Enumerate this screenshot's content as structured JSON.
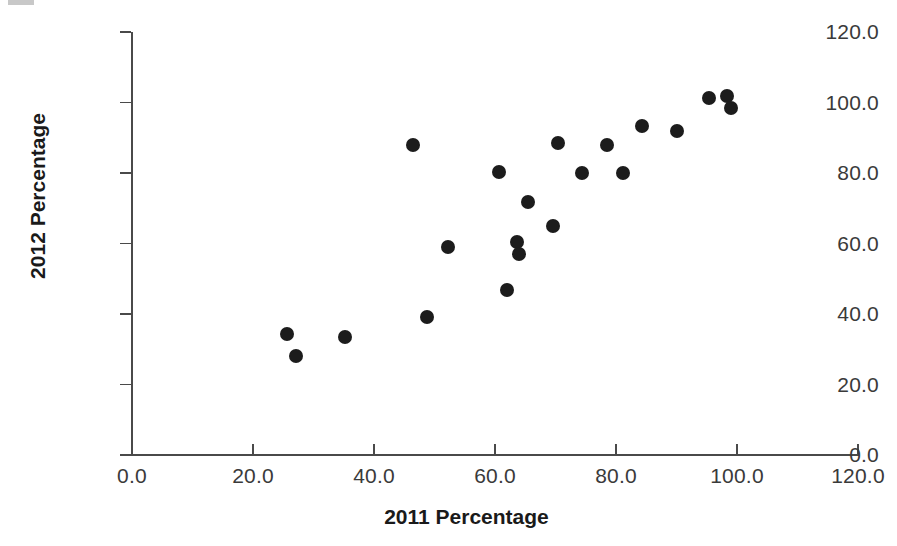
{
  "chart_data": {
    "type": "scatter",
    "title": "",
    "xlabel": "2011 Percentage",
    "ylabel": "2012 Percentage",
    "xlim": [
      0,
      120
    ],
    "ylim": [
      0,
      120
    ],
    "grid": false,
    "legend": null,
    "marker": {
      "shape": "circle",
      "color": "#1c1c1c",
      "size_px": 14
    },
    "xticks": [
      "0.0",
      "20.0",
      "40.0",
      "60.0",
      "80.0",
      "100.0",
      "120.0"
    ],
    "xtick_values": [
      0,
      20,
      40,
      60,
      80,
      100,
      120
    ],
    "yticks": [
      "0.0",
      "20.0",
      "40.0",
      "60.0",
      "80.0",
      "100.0",
      "120.0"
    ],
    "ytick_values": [
      0,
      20,
      40,
      60,
      80,
      100,
      120
    ],
    "points": [
      {
        "x": 25.6,
        "y": 34.3
      },
      {
        "x": 27.1,
        "y": 28.1
      },
      {
        "x": 35.2,
        "y": 33.5
      },
      {
        "x": 46.4,
        "y": 88.0
      },
      {
        "x": 48.7,
        "y": 39.2
      },
      {
        "x": 52.3,
        "y": 59.0
      },
      {
        "x": 60.6,
        "y": 80.3
      },
      {
        "x": 62.0,
        "y": 46.8
      },
      {
        "x": 63.6,
        "y": 60.4
      },
      {
        "x": 64.0,
        "y": 57.0
      },
      {
        "x": 65.5,
        "y": 71.8
      },
      {
        "x": 69.6,
        "y": 65.0
      },
      {
        "x": 70.4,
        "y": 88.5
      },
      {
        "x": 74.4,
        "y": 80.0
      },
      {
        "x": 78.5,
        "y": 88.0
      },
      {
        "x": 81.2,
        "y": 80.0
      },
      {
        "x": 84.3,
        "y": 93.3
      },
      {
        "x": 90.1,
        "y": 91.9
      },
      {
        "x": 95.4,
        "y": 101.3
      },
      {
        "x": 98.3,
        "y": 101.8
      },
      {
        "x": 99.0,
        "y": 98.4
      }
    ]
  }
}
